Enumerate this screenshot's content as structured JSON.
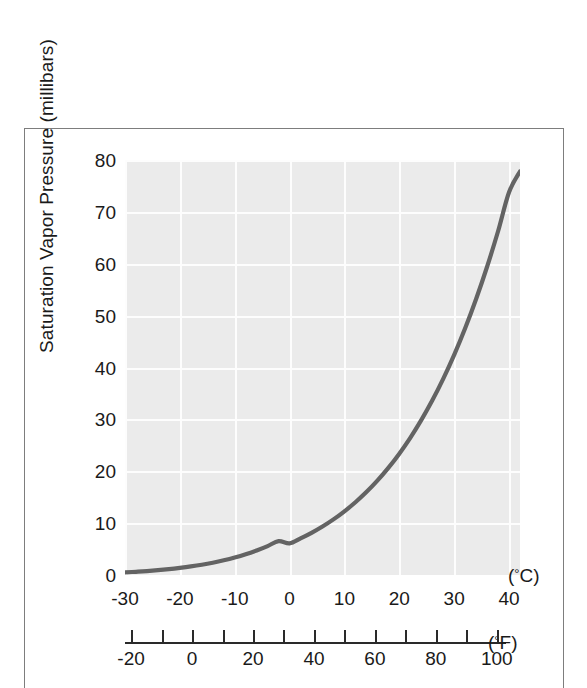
{
  "figure": {
    "frame_border_color": "#7d7d7d",
    "plot_background_color": "#ebebeb",
    "grid_color": "#fdfdfd",
    "curve_color": "#636363"
  },
  "axes": {
    "y_title": "Saturation Vapor Pressure (millibars)",
    "celsius_unit_label": "(°C)",
    "fahrenheit_unit_label": "(°F)",
    "celsius_unit_prefix": "(",
    "celsius_unit_deg": "°",
    "celsius_unit_suffix": "C)",
    "fahrenheit_unit_prefix": "(",
    "fahrenheit_unit_deg": "°",
    "fahrenheit_unit_suffix": "F)"
  },
  "chart_data": {
    "type": "line",
    "title": "",
    "subtitle": "",
    "xlabel": "(°C)",
    "ylabel": "Saturation Vapor Pressure (millibars)",
    "secondary_xlabel": "(°F)",
    "xlim": [
      -30,
      42
    ],
    "ylim": [
      0,
      80
    ],
    "secondary_xlim": [
      -22,
      107.6
    ],
    "grid": true,
    "legend": null,
    "y_ticks": [
      0,
      10,
      20,
      30,
      40,
      50,
      60,
      70,
      80
    ],
    "y_tick_labels": [
      "0",
      "10",
      "20",
      "30",
      "40",
      "50",
      "60",
      "70",
      "80"
    ],
    "x_ticks": [
      -30,
      -20,
      -10,
      0,
      10,
      20,
      30,
      40
    ],
    "x_tick_labels": [
      "-30",
      "-20",
      "-10",
      "0",
      "10",
      "20",
      "30",
      "40"
    ],
    "secondary_x_ticks": [
      -20,
      -10,
      0,
      10,
      20,
      30,
      40,
      50,
      60,
      70,
      80,
      90,
      100
    ],
    "secondary_x_tick_labels": [
      "-20",
      "",
      "0",
      "",
      "20",
      "",
      "40",
      "",
      "60",
      "",
      "80",
      "",
      "100"
    ],
    "series": [
      {
        "name": "Saturation vapor pressure over water",
        "x": [
          -30,
          -28,
          -26,
          -24,
          -22,
          -20,
          -18,
          -16,
          -14,
          -12,
          -10,
          -8,
          -6,
          -4,
          -2,
          0,
          2,
          4,
          6,
          8,
          10,
          12,
          14,
          16,
          18,
          20,
          22,
          24,
          26,
          28,
          30,
          32,
          34,
          36,
          38,
          40,
          42
        ],
        "values": [
          0.51,
          0.62,
          0.76,
          0.93,
          1.13,
          1.37,
          1.65,
          1.98,
          2.37,
          2.83,
          3.37,
          4.0,
          4.73,
          5.57,
          6.54,
          6.11,
          7.06,
          8.13,
          9.35,
          10.72,
          12.28,
          14.02,
          15.98,
          18.18,
          20.64,
          23.39,
          26.45,
          29.85,
          33.62,
          37.8,
          42.43,
          47.55,
          53.2,
          59.42,
          66.26,
          73.78,
          77.8
        ]
      }
    ]
  },
  "y_tick_items": [
    {
      "label": "80",
      "value": 80
    },
    {
      "label": "70",
      "value": 70
    },
    {
      "label": "60",
      "value": 60
    },
    {
      "label": "50",
      "value": 50
    },
    {
      "label": "40",
      "value": 40
    },
    {
      "label": "30",
      "value": 30
    },
    {
      "label": "20",
      "value": 20
    },
    {
      "label": "10",
      "value": 10
    },
    {
      "label": "0",
      "value": 0
    }
  ],
  "c_tick_items": [
    {
      "label": "-30",
      "value": -30
    },
    {
      "label": "-20",
      "value": -20
    },
    {
      "label": "-10",
      "value": -10
    },
    {
      "label": "0",
      "value": 0
    },
    {
      "label": "10",
      "value": 10
    },
    {
      "label": "20",
      "value": 20
    },
    {
      "label": "30",
      "value": 30
    },
    {
      "label": "40",
      "value": 40
    }
  ],
  "f_tick_items": [
    {
      "label": "-20",
      "value": -20,
      "labeled": true
    },
    {
      "label": "",
      "value": -10,
      "labeled": false
    },
    {
      "label": "0",
      "value": 0,
      "labeled": true
    },
    {
      "label": "",
      "value": 10,
      "labeled": false
    },
    {
      "label": "20",
      "value": 20,
      "labeled": true
    },
    {
      "label": "",
      "value": 30,
      "labeled": false
    },
    {
      "label": "40",
      "value": 40,
      "labeled": true
    },
    {
      "label": "",
      "value": 50,
      "labeled": false
    },
    {
      "label": "60",
      "value": 60,
      "labeled": true
    },
    {
      "label": "",
      "value": 70,
      "labeled": false
    },
    {
      "label": "80",
      "value": 80,
      "labeled": true
    },
    {
      "label": "",
      "value": 90,
      "labeled": false
    },
    {
      "label": "100",
      "value": 100,
      "labeled": true
    }
  ]
}
